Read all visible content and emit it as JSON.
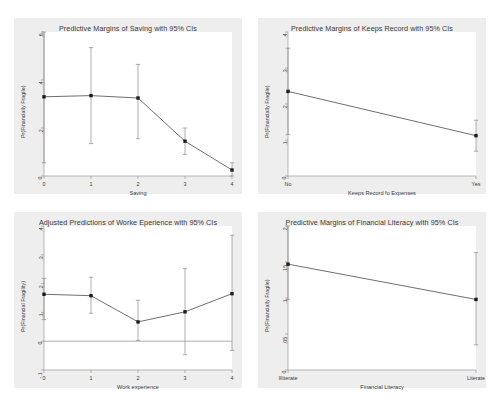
{
  "figure": {
    "background": "#ffffff",
    "panel_background": "#eeeeee",
    "plot_background": "#ffffff",
    "line_color": "#4a4a4a",
    "ci_color": "#8c8c8c",
    "marker_color": "#1c1c1c",
    "axis_color": "#9a9a9a",
    "text_color": "#3a3a3a"
  },
  "chart_data": [
    {
      "id": "saving",
      "type": "line",
      "title": "Predictive Margins of Saving with 95% CIs",
      "xlabel": "Saving",
      "ylabel": "Pr(Financially Fragile)",
      "categories": [
        "0",
        "1",
        "2",
        "3",
        "4"
      ],
      "x": [
        0,
        1,
        2,
        3,
        4
      ],
      "values": [
        0.33,
        0.335,
        0.325,
        0.145,
        0.025
      ],
      "ci_lower": [
        0.055,
        0.135,
        0.155,
        0.09,
        0.0
      ],
      "ci_upper": [
        0.605,
        0.535,
        0.465,
        0.2,
        0.055
      ],
      "ylim": [
        0,
        0.6
      ],
      "yticks": [
        0,
        0.2,
        0.4,
        0.6
      ],
      "ytick_labels": [
        "0",
        ".2",
        ".4",
        ".6"
      ],
      "grid": false,
      "legend": "none"
    },
    {
      "id": "keeps-record",
      "type": "line",
      "title": "Predictive Margins of Keeps Record with 95% CIs",
      "xlabel": "Keeps Record fo Expenses",
      "ylabel": "Pr(Financially Fragile)",
      "categories": [
        "No",
        "Yes"
      ],
      "x": [
        0,
        1
      ],
      "values": [
        0.235,
        0.112
      ],
      "ci_lower": [
        0.115,
        0.069
      ],
      "ci_upper": [
        0.355,
        0.155
      ],
      "ylim": [
        0,
        0.4
      ],
      "yticks": [
        0,
        0.1,
        0.2,
        0.3,
        0.4
      ],
      "ytick_labels": [
        "0",
        ".1",
        ".2",
        ".3",
        ".4"
      ],
      "grid": false,
      "legend": "none"
    },
    {
      "id": "work-experience",
      "type": "line",
      "title": "Adjusted Predictions of Worke Eperience with 95% CIs",
      "xlabel": "Work experience",
      "ylabel": "Pr(Financial Fragility)",
      "categories": [
        "0",
        "1",
        "2",
        "3",
        "4"
      ],
      "x": [
        0,
        1,
        2,
        3,
        4
      ],
      "values": [
        0.163,
        0.158,
        0.067,
        0.102,
        0.165
      ],
      "ci_lower": [
        0.075,
        0.097,
        0.003,
        -0.047,
        -0.032
      ],
      "ci_upper": [
        0.218,
        0.222,
        0.142,
        0.252,
        0.368
      ],
      "ylim": [
        -0.1,
        0.4
      ],
      "yticks": [
        -0.1,
        0,
        0.1,
        0.2,
        0.3,
        0.4
      ],
      "ytick_labels": [
        "-.1",
        "0",
        ".1",
        ".2",
        ".3",
        ".4"
      ],
      "zero_reference_line": 0,
      "grid": false,
      "legend": "none"
    },
    {
      "id": "financial-literacy",
      "type": "line",
      "title": "Predictive Margins of Financial Literacy with 95% CIs",
      "xlabel": "Financial Literacy",
      "ylabel": "Pr(Financially Fragile)",
      "categories": [
        "Illiterate",
        "Literate"
      ],
      "x": [
        0,
        1
      ],
      "values": [
        0.147,
        0.098
      ],
      "ci_lower": [
        0.098,
        0.035
      ],
      "ci_upper": [
        0.2,
        0.163
      ],
      "ylim": [
        0,
        0.2
      ],
      "yticks": [
        0,
        0.05,
        0.1,
        0.15,
        0.2
      ],
      "ytick_labels": [
        "0",
        ".05",
        ".1",
        ".15",
        ".2"
      ],
      "grid": false,
      "legend": "none"
    }
  ]
}
